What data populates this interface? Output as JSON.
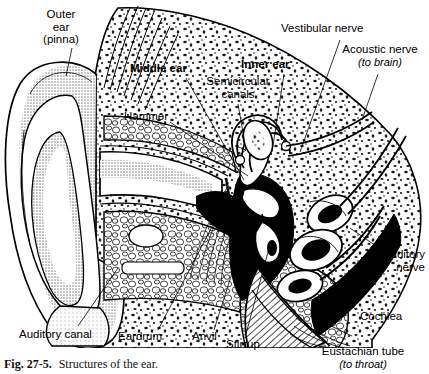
{
  "figure": {
    "number": "Fig. 27-5.",
    "caption": "Structures of the ear.",
    "title": "Structures of the ear",
    "colors": {
      "ink": "#000000",
      "paper": "#ffffff",
      "halftone_grey": "#9a9a9a",
      "light_grey": "#cfcfcf"
    }
  },
  "labels": {
    "outer_ear": {
      "line1": "Outer",
      "line2": "ear",
      "line3": "(pinna)"
    },
    "middle_ear": {
      "text": "Middle ear"
    },
    "hammer": {
      "text": "Hammer"
    },
    "semicircular": {
      "line1": "Semicircular",
      "line2": "canals"
    },
    "inner_ear": {
      "text": "Inner ear"
    },
    "vestibular": {
      "text": "Vestibular nerve"
    },
    "acoustic": {
      "text": "Acoustic nerve",
      "sub": "(to brain)"
    },
    "auditory_nerve": {
      "line1": "Auditory",
      "line2": "nerve"
    },
    "cochlea": {
      "text": "Cochlea"
    },
    "eustachian": {
      "text": "Eustachian tube",
      "sub": "(to throat)"
    },
    "stirrup": {
      "text": "Stirrup"
    },
    "anvil": {
      "text": "Anvil"
    },
    "eardrum": {
      "text": "Eardrum"
    },
    "auditory_canal": {
      "text": "Auditory canal"
    }
  }
}
